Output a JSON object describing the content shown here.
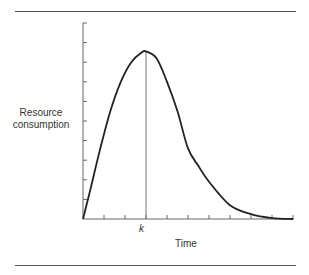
{
  "chart_data": {
    "type": "line",
    "title": "",
    "xlabel": "Time",
    "ylabel": "Resource consumption",
    "x_tick_labels": [
      {
        "position": 3,
        "label": "k"
      }
    ],
    "x_ticks": 10,
    "y_ticks": 10,
    "grid": false,
    "legend": null,
    "annotations": [
      {
        "type": "vertical-line",
        "x": "k",
        "note": "peak of curve"
      }
    ],
    "series": [
      {
        "name": "Resource consumption",
        "x": [
          0,
          0.35,
          0.8,
          1.3,
          1.8,
          2.3,
          2.8,
          3.0,
          3.5,
          4.0,
          4.5,
          5.0,
          5.5,
          6.0,
          7.0,
          8.0,
          9.0,
          10.0
        ],
        "y": [
          0,
          1.5,
          3.5,
          5.5,
          7.0,
          8.0,
          8.5,
          8.55,
          8.2,
          7.0,
          5.5,
          3.6,
          2.7,
          1.9,
          0.7,
          0.25,
          0.05,
          0
        ]
      }
    ],
    "xlim": [
      0,
      10
    ],
    "ylim": [
      0,
      10
    ]
  },
  "labels": {
    "ylabel": "Resource consumption",
    "ylabel_line1": "Resource",
    "ylabel_line2": "consumption",
    "k": "k",
    "xlabel": "Time"
  }
}
